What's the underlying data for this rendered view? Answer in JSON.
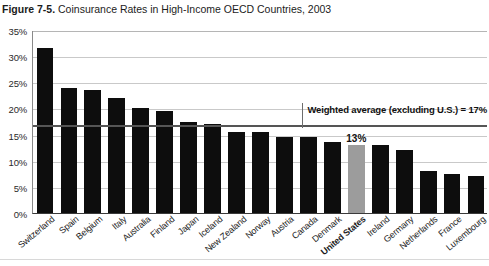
{
  "caption": {
    "figure_number": "Figure 7-5.",
    "title": "Coinsurance Rates in High-Income OECD Countries, 2003"
  },
  "chart_data": {
    "type": "bar",
    "title": "Coinsurance Rates in High-Income OECD Countries, 2003",
    "xlabel": "",
    "ylabel": "",
    "ylim": [
      0,
      35
    ],
    "ytick_labels": [
      "0%",
      "5%",
      "10%",
      "15%",
      "20%",
      "25%",
      "30%",
      "35%"
    ],
    "ytick_values": [
      0,
      5,
      10,
      15,
      20,
      25,
      30,
      35
    ],
    "grid": true,
    "legend": "none",
    "categories": [
      "Switzerland",
      "Spain",
      "Belgium",
      "Italy",
      "Australia",
      "Finland",
      "Japan",
      "Iceland",
      "New Zealand",
      "Norway",
      "Austria",
      "Canada",
      "Denmark",
      "United States",
      "Ireland",
      "Germany",
      "Netherlands",
      "France",
      "Luxembourg"
    ],
    "values": [
      31.5,
      24,
      23.5,
      22,
      20,
      19.5,
      17.5,
      17,
      15.5,
      15.5,
      14.5,
      14.5,
      13.5,
      13,
      13,
      12,
      8,
      7.5,
      7
    ],
    "highlight_category": "United States",
    "highlight_color": "#9c9c9c",
    "bar_color": "#0d0d0d",
    "data_labels": [
      {
        "category": "United States",
        "text": "13%"
      }
    ],
    "reference_line": {
      "value": 17,
      "label": "Weighted average (excluding U.S.) = 17%",
      "color": "#555555"
    }
  }
}
